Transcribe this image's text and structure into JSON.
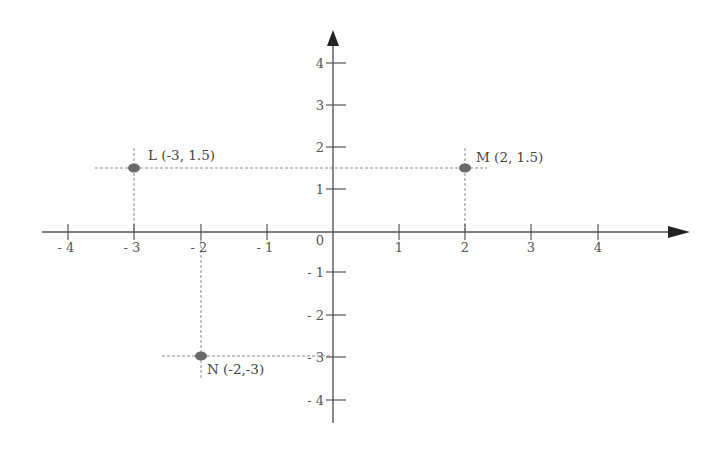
{
  "diagram": {
    "type": "coordinate-plane",
    "origin_label": "0",
    "x_ticks": [
      {
        "value": -4,
        "label": "- 4"
      },
      {
        "value": -3,
        "label": "- 3"
      },
      {
        "value": -2,
        "label": "- 2"
      },
      {
        "value": -1,
        "label": "- 1"
      },
      {
        "value": 1,
        "label": "1"
      },
      {
        "value": 2,
        "label": "2"
      },
      {
        "value": 3,
        "label": "3"
      },
      {
        "value": 4,
        "label": "4"
      }
    ],
    "y_ticks": [
      {
        "value": 4,
        "label": "4"
      },
      {
        "value": 3,
        "label": "3"
      },
      {
        "value": 2,
        "label": "2"
      },
      {
        "value": 1,
        "label": "1"
      },
      {
        "value": -1,
        "label": "- 1"
      },
      {
        "value": -2,
        "label": "- 2"
      },
      {
        "value": -3,
        "label": "- 3"
      },
      {
        "value": -4,
        "label": "- 4"
      }
    ],
    "points": [
      {
        "name": "L",
        "x": -3,
        "y": 1.5,
        "label": "L (-3, 1.5)"
      },
      {
        "name": "M",
        "x": 2,
        "y": 1.5,
        "label": "M (2, 1.5)"
      },
      {
        "name": "N",
        "x": -2,
        "y": -3,
        "label": "N (-2,-3)"
      }
    ],
    "colors": {
      "axis": "#555555",
      "guide": "#8a8a8a",
      "point": "#6a6a6a",
      "text": "#555555"
    }
  }
}
